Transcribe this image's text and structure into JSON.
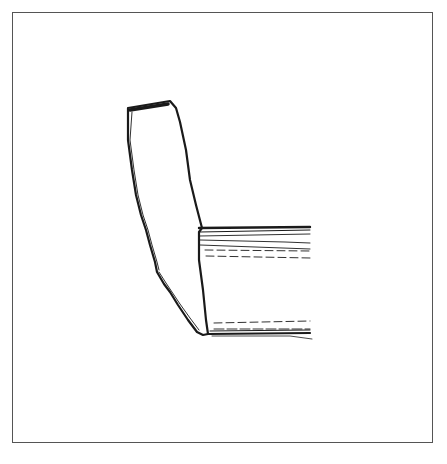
{
  "figure": {
    "type": "line-drawing",
    "colors": {
      "background": "#ffffff",
      "frame": "#555555",
      "ink": "#1a1a1a"
    },
    "frame": {
      "x": 12,
      "y": 12,
      "width": 421,
      "height": 431
    },
    "caption": ""
  }
}
